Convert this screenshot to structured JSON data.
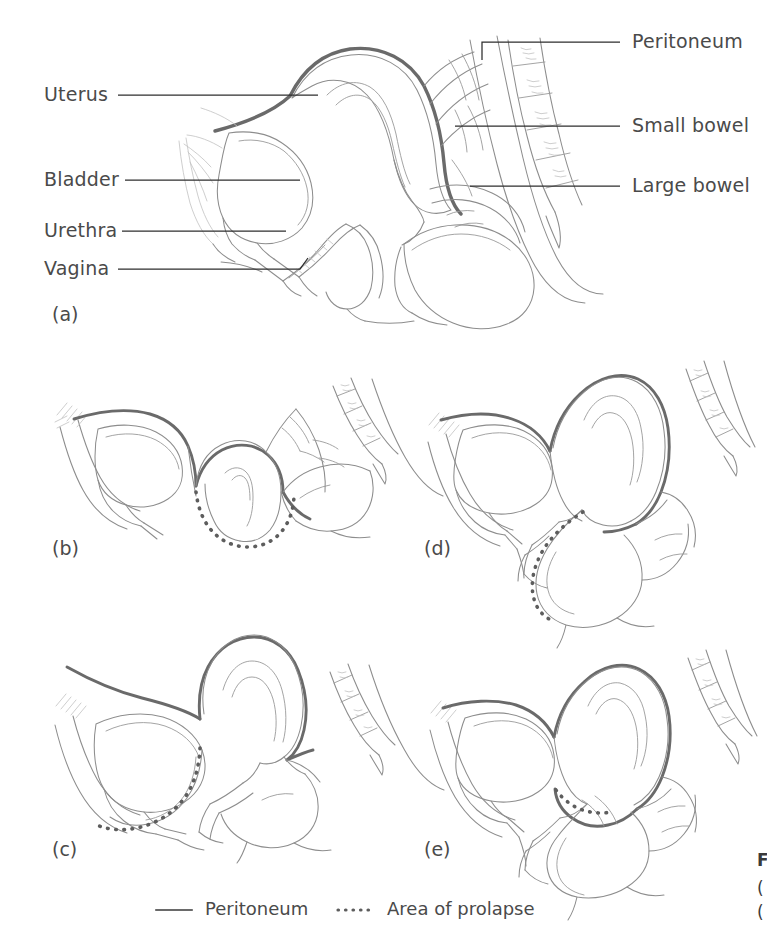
{
  "figure": {
    "type": "medical-illustration",
    "panels": [
      {
        "letter": "(a)",
        "name": "normal-anatomy"
      },
      {
        "letter": "(b)",
        "name": "uterine-prolapse"
      },
      {
        "letter": "(c)",
        "name": "cystocele-anterior-prolapse"
      },
      {
        "letter": "(d)",
        "name": "rectocele-posterior-prolapse"
      },
      {
        "letter": "(e)",
        "name": "enterocele"
      }
    ]
  },
  "panel_a": {
    "labels_left": [
      {
        "text": "Uterus",
        "name": "uterus"
      },
      {
        "text": "Bladder",
        "name": "bladder"
      },
      {
        "text": "Urethra",
        "name": "urethra"
      },
      {
        "text": "Vagina",
        "name": "vagina"
      }
    ],
    "labels_right": [
      {
        "text": "Peritoneum",
        "name": "peritoneum"
      },
      {
        "text": "Small bowel",
        "name": "small-bowel"
      },
      {
        "text": "Large bowel",
        "name": "large-bowel"
      }
    ]
  },
  "panel_letters": {
    "a": "(a)",
    "b": "(b)",
    "c": "(c)",
    "d": "(d)",
    "e": "(e)"
  },
  "legend": {
    "items": [
      {
        "label": "Peritoneum",
        "style": "solid",
        "name": "legend-peritoneum"
      },
      {
        "label": "Area of prolapse",
        "style": "dotted",
        "name": "legend-area-of-prolapse"
      }
    ]
  },
  "edge_caption": {
    "line1": "F",
    "line2": "(",
    "line3": "("
  },
  "colors": {
    "background": "#ffffff",
    "text": "#4a4a4a",
    "outline": "#8d8d8d",
    "peritoneum": "#6a6a6a",
    "prolapse": "#5d5d5d",
    "leader": "#2e2e2e"
  }
}
